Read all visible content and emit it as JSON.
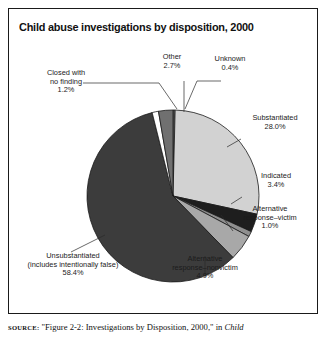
{
  "running_head": "",
  "figure": {
    "title": "Child abuse investigations by disposition, 2000",
    "source_label": "SOURCE:",
    "source_text": " \"Figure 2-2: Investigations by Disposition, 2000,\" in ",
    "source_italic": "Child"
  },
  "chart_data": {
    "type": "pie",
    "title": "Child abuse investigations by disposition, 2000",
    "unit": "percent",
    "start_angle_deg": 0,
    "direction": "clockwise",
    "categories": [
      "Unknown",
      "Substantiated",
      "Indicated",
      "Alternative response–victim",
      "Alternative response–nonvictim",
      "Unsubstantiated (includes intentionally false)",
      "Closed with no finding",
      "Other"
    ],
    "values": [
      0.4,
      28.0,
      3.4,
      1.0,
      4.9,
      58.4,
      1.2,
      2.7
    ],
    "colors": [
      "#6e6e6e",
      "#d2d2d2",
      "#1e1e1e",
      "#8f8f8f",
      "#a8a8a8",
      "#3c3c3c",
      "#ffffff",
      "#707070"
    ],
    "legend": "labels-with-leader-lines",
    "slices": [
      {
        "label": "Unknown",
        "value_text": "0.4%",
        "value": 0.4,
        "color": "#6e6e6e"
      },
      {
        "label": "Substantiated",
        "value_text": "28.0%",
        "value": 28.0,
        "color": "#d2d2d2"
      },
      {
        "label": "Indicated",
        "value_text": "3.4%",
        "value": 3.4,
        "color": "#1e1e1e"
      },
      {
        "label": "Alternative response–victim",
        "value_text": "1.0%",
        "value": 1.0,
        "color": "#8f8f8f"
      },
      {
        "label": "Alternative response–nonvictim",
        "value_text": "4.9%",
        "value": 4.9,
        "color": "#a8a8a8"
      },
      {
        "label": "Unsubstantiated (includes intentionally false)",
        "value_text": "58.4%",
        "value": 58.4,
        "color": "#3c3c3c"
      },
      {
        "label": "Closed with no finding",
        "value_text": "1.2%",
        "value": 1.2,
        "color": "#ffffff"
      },
      {
        "label": "Other",
        "value_text": "2.7%",
        "value": 2.7,
        "color": "#707070"
      }
    ]
  },
  "labels": {
    "closed_line1": "Closed with",
    "closed_line2": "no finding",
    "closed_pct": "1.2%",
    "other_line1": "Other",
    "other_pct": "2.7%",
    "unknown_line1": "Unknown",
    "unknown_pct": "0.4%",
    "substantiated_line1": "Substantiated",
    "substantiated_pct": "28.0%",
    "indicated_line1": "Indicated",
    "indicated_pct": "3.4%",
    "altvictim_line1": "Alternative",
    "altvictim_line2": "response–victim",
    "altvictim_pct": "1.0%",
    "altnonvictim_line1": "Alternative",
    "altnonvictim_line2": "response–nonvictim",
    "altnonvictim_pct": "4.9%",
    "unsub_line1": "Unsubstantiated",
    "unsub_line2": "(includes intentionally false)",
    "unsub_pct": "58.4%"
  }
}
